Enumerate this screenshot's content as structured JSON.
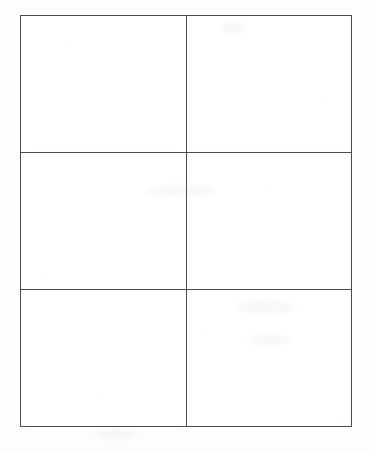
{
  "document": {
    "kind": "scanned-paper-form",
    "background_color": "#fdfdfd",
    "page_width": 369,
    "page_height": 451
  },
  "table": {
    "name": "empty-grid-table",
    "columns": 2,
    "rows": 3,
    "border_color": "#4a4a52",
    "border_width_px": 1,
    "cell_background": "#ffffff",
    "left_px": 20,
    "top_px": 15,
    "width_px": 332,
    "height_px": 412,
    "vertical_divider_x_px": 186,
    "horizontal_divider_y_px": [
      155,
      292
    ],
    "cells": [
      {
        "row": 0,
        "col": 0,
        "text": ""
      },
      {
        "row": 0,
        "col": 1,
        "text": ""
      },
      {
        "row": 1,
        "col": 0,
        "text": ""
      },
      {
        "row": 1,
        "col": 1,
        "text": ""
      },
      {
        "row": 2,
        "col": 0,
        "text": ""
      },
      {
        "row": 2,
        "col": 1,
        "text": ""
      }
    ]
  }
}
